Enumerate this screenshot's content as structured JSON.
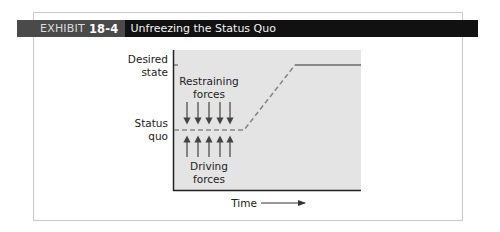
{
  "header": {
    "exhibit_label": "EXHIBIT",
    "exhibit_number": "18-4",
    "title": "Unfreezing the Status Quo"
  },
  "diagram": {
    "y_labels": {
      "desired_line1": "Desired",
      "desired_line2": "state",
      "status_line1": "Status",
      "status_line2": "quo"
    },
    "restraining_line1": "Restraining",
    "restraining_line2": "forces",
    "driving_line1": "Driving",
    "driving_line2": "forces",
    "x_label": "Time",
    "colors": {
      "plot_bg": "#e4e4e4",
      "line": "#888888",
      "arrow": "#444444",
      "header_bg": "#111111",
      "header_exhibit_bg": "#4a4a4a"
    }
  }
}
